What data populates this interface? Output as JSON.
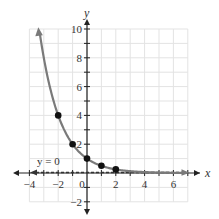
{
  "chart_data": {
    "type": "line",
    "title": "",
    "function": "y = (1/2)^x",
    "xlabel": "x",
    "ylabel": "y",
    "xlim": [
      -4,
      7
    ],
    "ylim": [
      -2,
      10
    ],
    "grid": true,
    "x_ticks": [
      -4,
      -2,
      0,
      2,
      4,
      6
    ],
    "y_ticks": [
      -2,
      2,
      4,
      6,
      8,
      10
    ],
    "points": [
      {
        "x": -2,
        "y": 4
      },
      {
        "x": -1,
        "y": 2
      },
      {
        "x": 0,
        "y": 1
      },
      {
        "x": 1,
        "y": 0.5
      },
      {
        "x": 2,
        "y": 0.25
      }
    ],
    "asymptote": {
      "type": "horizontal",
      "value": 0,
      "label": "y = 0",
      "style": "dashed"
    },
    "colors": {
      "curve": "#7a7a7a",
      "points": "#111111",
      "axis": "#222222",
      "grid": "#e3e3e3"
    }
  },
  "labels": {
    "x_axis": "x",
    "y_axis": "y",
    "asymptote": "y = 0",
    "x_ticks": [
      "−4",
      "−2",
      "0",
      "2",
      "4",
      "6"
    ],
    "y_ticks": [
      "10",
      "8",
      "6",
      "4",
      "2",
      "−2"
    ]
  }
}
